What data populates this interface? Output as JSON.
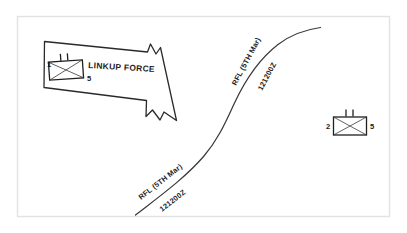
{
  "figure": {
    "kind": "military-tactical-graphic",
    "width": 407,
    "height": 233,
    "background_color": "#ffffff",
    "frame_color": "#e2e2e2",
    "ink_color": "#262626"
  },
  "labels": {
    "linkup_force": "LINKUP FORCE",
    "rfl_upper": "RFL (5TH Mar)",
    "dtg_upper": "121200Z",
    "rfl_lower": "RFL (5TH Mar)",
    "dtg_lower": "121200Z"
  },
  "units": [
    {
      "id": "left-unit",
      "left_designator": "1",
      "right_designator": "5",
      "branch": "infantry",
      "echelon": "battalion",
      "echelon_tick_count": 2
    },
    {
      "id": "right-unit",
      "left_designator": "2",
      "right_designator": "5",
      "branch": "infantry",
      "echelon": "battalion",
      "echelon_tick_count": 2
    }
  ],
  "graphics": {
    "axis_of_advance": {
      "name": "linkup-force-arrow",
      "direction": "east-southeast"
    },
    "boundary_line": {
      "name": "restrictive-fire-line",
      "abbreviation": "RFL",
      "shape": "s-curve"
    }
  }
}
